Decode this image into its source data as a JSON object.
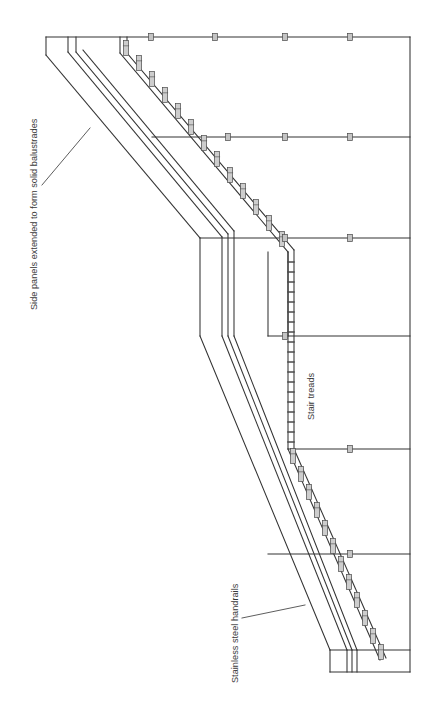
{
  "drawing": {
    "type": "architectural-elevation",
    "subject": "Staircase with solid balustrades and stainless steel handrails",
    "orientation": "rotated-90",
    "background_color": "#ffffff",
    "line_color": "#333333",
    "baluster_fill": "#c9c9c9",
    "text_color": "#3a3a3a",
    "annotations": [
      {
        "id": "balustrades",
        "text": "Side panels extended to form solid balustrades",
        "rotation": -90,
        "leader": "diagonal leader from text to upper stair stringer"
      },
      {
        "id": "treads",
        "text": "Stair treads",
        "rotation": -90,
        "leader": "none"
      },
      {
        "id": "handrails",
        "text": "Stainless steel handrails",
        "rotation": -90,
        "leader": "diagonal leader from text to lower handrail pair"
      }
    ],
    "geometry": {
      "floor_line_levels_y": [
        37,
        137,
        238,
        336,
        449,
        554,
        650
      ],
      "right_edge_x": 410,
      "left_edge_x": 46,
      "flights": 2,
      "landings": 2,
      "handrail_pairs_per_flight": 2,
      "balusters_upper_flight": 13,
      "balusters_lower_flight": 12,
      "landing_posts": 5
    }
  }
}
